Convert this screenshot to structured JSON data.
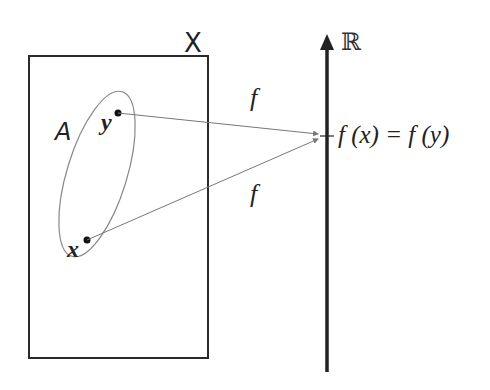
{
  "diagram": {
    "set_label": "X",
    "subset_label": "A",
    "point_y_label": "y",
    "point_x_label": "x",
    "map_label_top": "f",
    "map_label_bottom": "f",
    "codomain_label": "ℝ",
    "image_label": "f (x) = f (y)",
    "colors": {
      "stroke": "#2a2a2a",
      "thin_line": "#777777",
      "background": "#ffffff"
    }
  }
}
